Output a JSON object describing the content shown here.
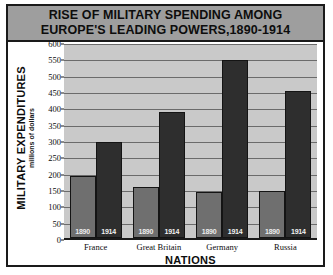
{
  "chart_data": {
    "type": "bar",
    "title": "RISE OF MILITARY SPENDING AMONG EUROPE'S LEADING POWERS,1890-1914",
    "title_lines": [
      "RISE OF MILITARY SPENDING AMONG",
      "EUROPE'S LEADING POWERS,1890-1914"
    ],
    "xlabel": "NATIONS",
    "ylabel": "MILITARY EXPENDITURES",
    "ylabel_sub": "millions of dollars",
    "categories": [
      "France",
      "Great Britain",
      "Germany",
      "Russia"
    ],
    "series": [
      {
        "name": "1890",
        "values": [
          190,
          155,
          140,
          145
        ],
        "color": "#6f6f6f"
      },
      {
        "name": "1914",
        "values": [
          293,
          385,
          545,
          450
        ],
        "color": "#2e2e2e"
      }
    ],
    "yticks": [
      0,
      50,
      100,
      150,
      200,
      250,
      300,
      350,
      400,
      450,
      500,
      550,
      600
    ],
    "ylim": [
      0,
      600
    ],
    "grid": true,
    "legend": "in-bar-labels",
    "bar_labels": [
      "1890",
      "1914"
    ]
  },
  "style": {
    "title_band": "#9e9e9e",
    "plot_background": "#c9c9c9",
    "gridline": "#6b6b6b",
    "frame": "#1a1a1a"
  }
}
